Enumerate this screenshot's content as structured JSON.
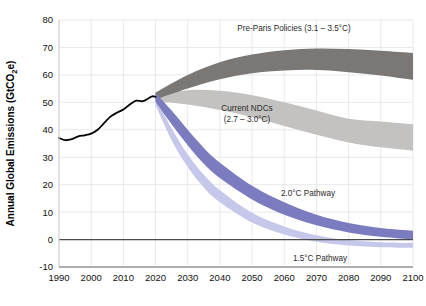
{
  "chart_data": {
    "type": "area",
    "title": "",
    "xlabel": "",
    "ylabel": "Annual Global Emissions (GtCO",
    "ylabel_sub": "2",
    "ylabel_tail": "e)",
    "xlim": [
      1990,
      2100
    ],
    "ylim": [
      -10,
      80
    ],
    "grid": true,
    "legend_position": "inline-annotations",
    "xticks": [
      1990,
      2000,
      2010,
      2020,
      2030,
      2040,
      2050,
      2060,
      2070,
      2080,
      2090,
      2100
    ],
    "yticks": [
      -10,
      0,
      10,
      20,
      30,
      40,
      50,
      60,
      70,
      80
    ],
    "zero_line": 0,
    "colors": {
      "historical": "#000000",
      "pre_paris": "#7a7775",
      "current_ndc": "#c4c2c0",
      "pathway_2c": "#7b7cc0",
      "pathway_15c": "#c5c8ea",
      "grid": "#e8e8ee",
      "zero_line": "#4a4a4a",
      "text": "#2b2b2b"
    },
    "series": [
      {
        "name": "Historical emissions",
        "type": "line",
        "x": [
          1990,
          1992,
          1994,
          1996,
          1998,
          2000,
          2002,
          2004,
          2006,
          2008,
          2010,
          2012,
          2014,
          2016,
          2018,
          2019,
          2020
        ],
        "values": [
          37.0,
          36.2,
          36.6,
          37.6,
          38.0,
          38.6,
          40.0,
          42.4,
          44.8,
          46.2,
          47.4,
          49.2,
          50.6,
          50.4,
          51.6,
          52.2,
          52.0
        ]
      },
      {
        "name": "Pre-Paris Policies",
        "type": "band",
        "x": [
          2020,
          2030,
          2040,
          2050,
          2060,
          2070,
          2080,
          2090,
          2100
        ],
        "upper": [
          53.6,
          60.0,
          64.6,
          67.4,
          69.0,
          69.6,
          69.4,
          68.8,
          68.0
        ],
        "lower": [
          51.0,
          55.0,
          58.4,
          60.6,
          61.6,
          61.8,
          61.0,
          59.8,
          58.2
        ]
      },
      {
        "name": "Current NDCs",
        "type": "band",
        "x": [
          2020,
          2030,
          2040,
          2050,
          2060,
          2070,
          2080,
          2090,
          2100
        ],
        "upper": [
          52.4,
          54.4,
          54.2,
          52.6,
          50.0,
          47.0,
          44.0,
          43.0,
          42.0
        ],
        "lower": [
          50.4,
          49.2,
          47.2,
          44.6,
          41.4,
          38.2,
          35.4,
          33.6,
          32.4
        ]
      },
      {
        "name": "2.0°C Pathway",
        "type": "band",
        "x": [
          2020,
          2025,
          2030,
          2035,
          2040,
          2050,
          2060,
          2070,
          2080,
          2090,
          2100
        ],
        "upper": [
          53.4,
          47.0,
          40.0,
          33.4,
          28.0,
          19.6,
          13.6,
          9.0,
          6.0,
          4.2,
          3.2
        ],
        "lower": [
          50.2,
          42.0,
          34.4,
          27.6,
          22.4,
          14.6,
          9.0,
          5.2,
          2.6,
          1.0,
          0.0
        ]
      },
      {
        "name": "1.5°C Pathway",
        "type": "band",
        "x": [
          2020,
          2025,
          2030,
          2035,
          2040,
          2050,
          2060,
          2070,
          2080,
          2090,
          2100
        ],
        "upper": [
          51.4,
          40.6,
          31.0,
          23.6,
          18.0,
          9.8,
          4.8,
          1.6,
          -0.2,
          -1.0,
          -1.2
        ],
        "lower": [
          49.0,
          36.2,
          26.4,
          19.0,
          13.6,
          6.2,
          1.8,
          -0.8,
          -2.2,
          -2.8,
          -3.0
        ]
      }
    ],
    "annotations": [
      {
        "id": "pre-paris",
        "lines": [
          "Pre-Paris Policies (3.1 – 3.5°C)"
        ],
        "x": 294,
        "y": 31
      },
      {
        "id": "current-ndcs",
        "lines": [
          "Current NDCs",
          "(2.7 – 3.0°C)"
        ],
        "x": 247,
        "y": 111
      },
      {
        "id": "pathway-2c",
        "lines": [
          "2.0°C Pathway"
        ],
        "x": 308,
        "y": 196
      },
      {
        "id": "pathway-15c",
        "lines": [
          "1.5°C Pathway"
        ],
        "x": 320,
        "y": 261
      }
    ]
  }
}
